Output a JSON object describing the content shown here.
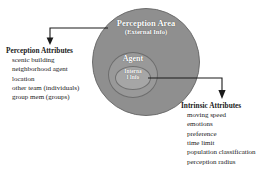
{
  "diagram": {
    "type": "concentric-circle-diagram",
    "colors": {
      "outer_circle": "#8f8f8f",
      "middle_circle": "#999999",
      "inner_circle": "#a6a6a6",
      "label_text": "#ffffff",
      "body_text": "#1a1a1a",
      "connector": "#1a1a1a",
      "background": "#ffffff"
    },
    "circles": {
      "outer": {
        "label": "Perception Area",
        "sublabel": "(External Info)"
      },
      "middle": {
        "label": "Agent"
      },
      "inner": {
        "label_line1": "Interna",
        "label_line2": "l Info",
        "label_full": "Internal Info"
      }
    },
    "callouts": [
      {
        "id": "perception-attributes",
        "title": "Perception Attributes",
        "items": [
          "scenic building",
          "neighborhood agent",
          "location",
          "other team (individuals)",
          "group mem (groups)"
        ]
      },
      {
        "id": "intrinsic-attributes",
        "title": "Intrinsic Attributes",
        "items": [
          "moving speed",
          "emotions",
          "preference",
          "time limit",
          "population classification",
          "perception radius"
        ]
      }
    ]
  }
}
